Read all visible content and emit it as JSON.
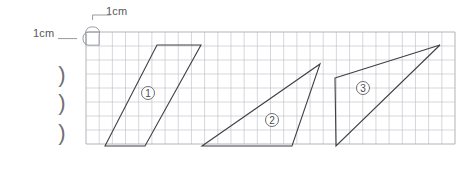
{
  "worksheet": {
    "background_color": "#ffffff",
    "grid": {
      "x": 86,
      "y": 32,
      "width": 369,
      "height": 112,
      "cell_size": 13.2,
      "line_color": "#b9bcc4",
      "border_color": "#a9acb4"
    },
    "measure_labels": {
      "horizontal": "1cm",
      "vertical": "1cm",
      "color": "#585858"
    },
    "unit_cell_marker": {
      "name": "unit-cell-bracket",
      "color": "#8d9097",
      "description": "rounded bracket outlining one 1cm grid square at the top-left of the grid"
    },
    "margin_marks": {
      "name": "left-margin-tick-marks",
      "glyph": ")",
      "count": 3,
      "color": "#6e7177",
      "positions_y": [
        82,
        110,
        140
      ],
      "x": 62
    },
    "shapes": [
      {
        "id": "shape-1",
        "label": "①",
        "type": "parallelogram",
        "stroke": "#3f3f46",
        "label_x": 148,
        "label_y": 93,
        "points": [
          [
            105,
            146
          ],
          [
            157,
            45
          ],
          [
            201,
            45
          ],
          [
            145,
            146
          ]
        ]
      },
      {
        "id": "shape-2",
        "label": "②",
        "type": "triangle",
        "stroke": "#3f3f46",
        "label_x": 272,
        "label_y": 120,
        "points": [
          [
            202,
            146
          ],
          [
            320,
            64
          ],
          [
            292,
            146
          ]
        ]
      },
      {
        "id": "shape-3",
        "label": "③",
        "type": "triangle-quad",
        "stroke": "#3f3f46",
        "label_x": 363,
        "label_y": 88,
        "points": [
          [
            335,
            78
          ],
          [
            440,
            45
          ],
          [
            336,
            146
          ]
        ]
      }
    ],
    "shape_labels": {
      "color": "#4a4a50",
      "circle_radius": 6.5,
      "font_size": 10
    }
  }
}
